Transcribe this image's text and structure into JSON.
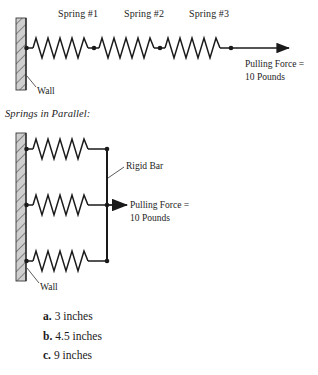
{
  "figure": {
    "series_section": {
      "spring_labels": [
        {
          "name": "spring-1-label",
          "text": "Spring #1"
        },
        {
          "name": "spring-2-label",
          "text": "Spring #2"
        },
        {
          "name": "spring-3-label",
          "text": "Spring #3"
        }
      ],
      "force_label_line1": "Pulling Force =",
      "force_label_line2": "10 Pounds",
      "wall_label": "Wall"
    },
    "parallel_section": {
      "heading": "Springs in Parallel:",
      "rigid_bar_label": "Rigid Bar",
      "force_label_line1": "Pulling Force =",
      "force_label_line2": "10 Pounds",
      "wall_label": "Wall"
    }
  },
  "answers": [
    {
      "letter": "a.",
      "text": "3 inches"
    },
    {
      "letter": "b.",
      "text": "4.5 inches"
    },
    {
      "letter": "c.",
      "text": "9 inches"
    }
  ],
  "colors": {
    "ink": "#1c1c1c",
    "wall_fill": "#c8c8c8",
    "wall_hatch": "#555555",
    "stroke": "#1a1a1a"
  }
}
